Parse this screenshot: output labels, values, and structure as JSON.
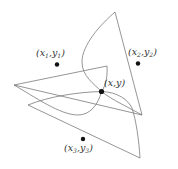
{
  "diagram": {
    "type": "geometric-illustration",
    "center_point": {
      "label_x": "x",
      "label_y": "y",
      "text": "(x,y)"
    },
    "sites": [
      {
        "id": 1,
        "label_x": "x",
        "sub": "1",
        "label_y": "y",
        "text": "(x1,y1)"
      },
      {
        "id": 2,
        "label_x": "x",
        "sub": "2",
        "label_y": "y",
        "text": "(x2,y2)"
      },
      {
        "id": 3,
        "label_x": "x",
        "sub": "3",
        "label_y": "y",
        "text": "(x3,y3)"
      }
    ],
    "colors": {
      "stroke": "#7a7a7a",
      "point": "#111111",
      "text": "#333333"
    }
  }
}
